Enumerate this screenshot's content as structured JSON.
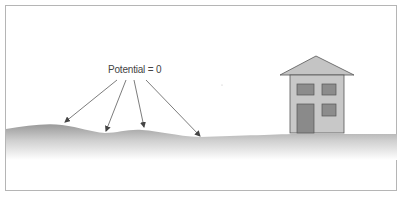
{
  "diagram": {
    "label": "Potential = 0",
    "arrow_count": 4,
    "elements": [
      "ground-surface",
      "house",
      "potential-label",
      "arrows"
    ],
    "colors": {
      "frame": "#b5b5b5",
      "ground_top": "#9a9a9a",
      "ground_fade": "#ffffff",
      "house_wall": "#c8c8c8",
      "house_roof": "#c4c4c4",
      "house_window": "#8c8c8c",
      "house_door": "#8a8a8a",
      "outline": "#555555",
      "text": "#444444"
    }
  }
}
